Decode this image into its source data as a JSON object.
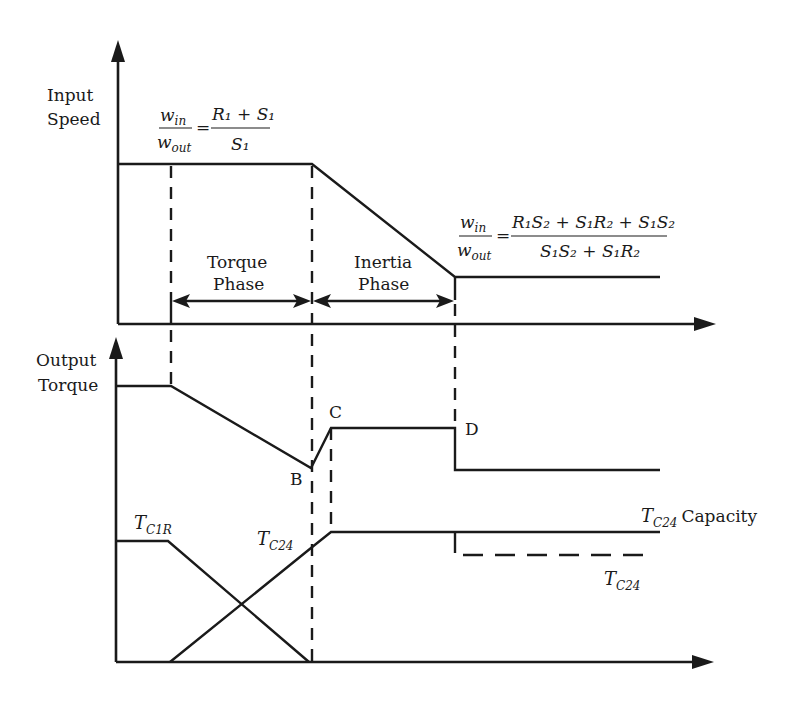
{
  "diagram": {
    "top_panel": {
      "y_axis_label": [
        "Input",
        "Speed"
      ],
      "ratio_before": {
        "lhs_num": "w",
        "lhs_num_sub": "in",
        "lhs_den": "w",
        "lhs_den_sub": "out",
        "rhs_num": "R₁ + S₁",
        "rhs_den": "S₁"
      },
      "ratio_after": {
        "lhs_num": "w",
        "lhs_num_sub": "in",
        "lhs_den": "w",
        "lhs_den_sub": "out",
        "rhs_num": "R₁S₂ + S₁R₂ + S₁S₂",
        "rhs_den": "S₁S₂ + S₁R₂"
      },
      "phases": [
        {
          "line1": "Torque",
          "line2": "Phase"
        },
        {
          "line1": "Inertia",
          "line2": "Phase"
        }
      ]
    },
    "bottom_panel": {
      "y_axis_label": [
        "Output",
        "Torque"
      ],
      "points": {
        "B": "B",
        "C": "C",
        "D": "D"
      },
      "tc1r": {
        "T": "T",
        "sub": "C1R"
      },
      "tc24": {
        "T": "T",
        "sub": "C24"
      },
      "tc24_capacity": {
        "T": "T",
        "sub": "C24",
        "suffix": "Capacity"
      },
      "tc24_dashed": {
        "T": "T",
        "sub": "C24"
      }
    }
  }
}
